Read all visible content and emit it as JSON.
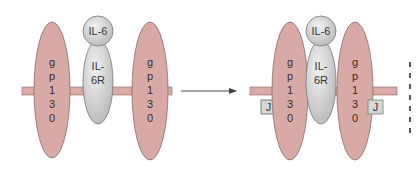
{
  "diagram": {
    "colors": {
      "gp130_fill": "#d9aaa5",
      "gp130_stroke": "#8a6a66",
      "membrane_fill": "#d9aaa5",
      "receptor_fill": "#cfcfcf",
      "receptor_stroke": "#777777",
      "jak_fill": "#d6d6d6",
      "arrow": "#444444",
      "text": "#3a2a2a"
    },
    "left_panel": {
      "ligand": "IL-6",
      "receptor_line1": "IL-",
      "receptor_line2": "6R",
      "gp130_a": [
        "g",
        "p",
        "1",
        "3",
        "0"
      ],
      "gp130_b": [
        "g",
        "p",
        "1",
        "3",
        "0"
      ]
    },
    "right_panel": {
      "ligand": "IL-6",
      "receptor_line1": "IL-",
      "receptor_line2": "6R",
      "gp130_a": [
        "g",
        "p",
        "1",
        "3",
        "0"
      ],
      "gp130_b": [
        "g",
        "p",
        "1",
        "3",
        "0"
      ],
      "jak_left": "J",
      "jak_right": "J"
    },
    "arrow": {
      "direction": "right"
    }
  }
}
